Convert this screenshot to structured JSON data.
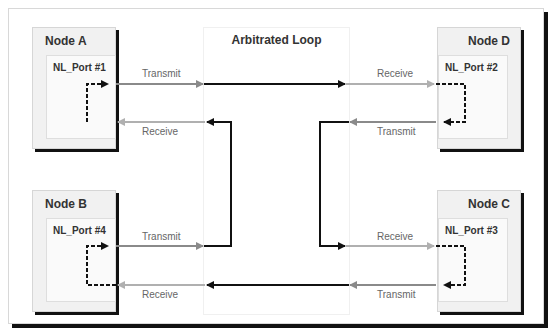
{
  "diagram": {
    "title": "Arbitrated Loop",
    "nodes": [
      {
        "id": "A",
        "label": "Node A",
        "port": "NL_Port #1",
        "tx": "Transmit",
        "rx": "Receive"
      },
      {
        "id": "D",
        "label": "Node D",
        "port": "NL_Port #2",
        "tx": "Transmit",
        "rx": "Receive"
      },
      {
        "id": "B",
        "label": "Node B",
        "port": "NL_Port #4",
        "tx": "Transmit",
        "rx": "Receive"
      },
      {
        "id": "C",
        "label": "Node C",
        "port": "NL_Port #3",
        "tx": "Transmit",
        "rx": "Receive"
      }
    ],
    "colors": {
      "loop_line": "#111111",
      "port_line_tx": "#888888",
      "port_line_rx": "#aaaaaa",
      "shadow": "#111111"
    }
  }
}
